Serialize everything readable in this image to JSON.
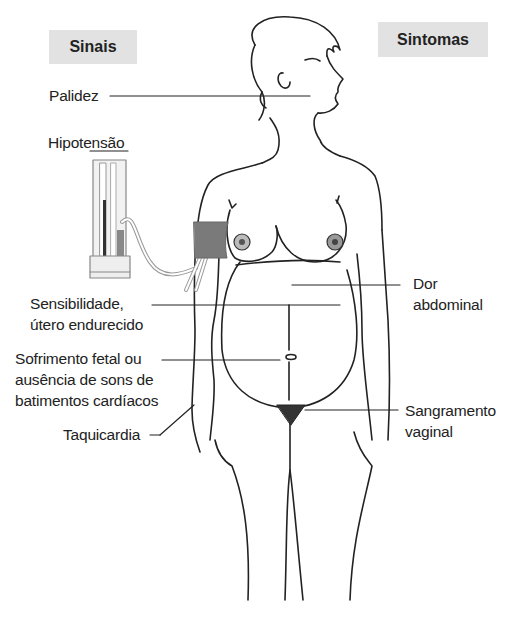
{
  "headers": {
    "signs": "Sinais",
    "symptoms": "Sintomas"
  },
  "signs": [
    {
      "id": "pallor",
      "label": "Palidez"
    },
    {
      "id": "hypotension",
      "label": "Hipotensão"
    },
    {
      "id": "tender-uterus",
      "lines": [
        "Sensibilidade,",
        "útero endurecido"
      ]
    },
    {
      "id": "fetal-distress",
      "lines": [
        "Sofrimento fetal ou",
        "ausência de sons de",
        "batimentos cardíacos"
      ]
    },
    {
      "id": "tachycardia",
      "label": "Taquicardia"
    }
  ],
  "symptoms": [
    {
      "id": "abdominal-pain",
      "lines": [
        "Dor",
        "abdominal"
      ]
    },
    {
      "id": "vaginal-bleeding",
      "lines": [
        "Sangramento",
        "vaginal"
      ]
    }
  ],
  "colors": {
    "header_bg": "#e2e2e2",
    "cuff": "#7a7a7a",
    "line": "#222222"
  }
}
